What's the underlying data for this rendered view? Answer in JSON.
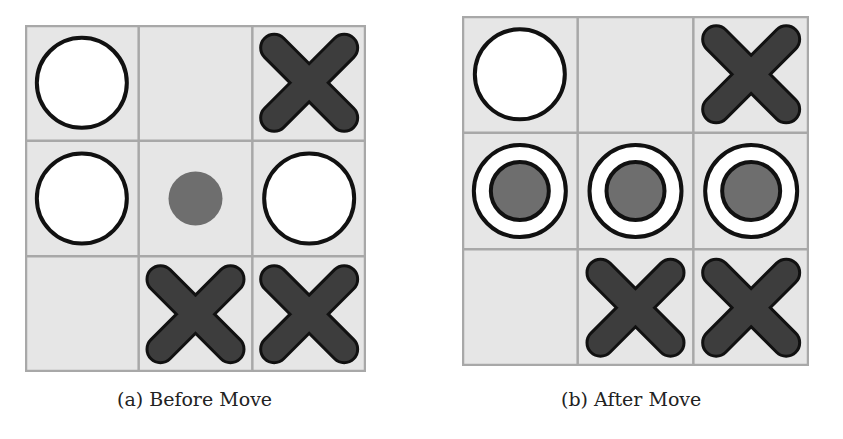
{
  "figure": {
    "panels": [
      {
        "id": "a",
        "caption": "(a) Before Move",
        "board": [
          [
            "O",
            "",
            "X"
          ],
          [
            "O",
            "dot",
            "O"
          ],
          [
            "",
            "X",
            "X"
          ]
        ]
      },
      {
        "id": "b",
        "caption": "(b) After Move",
        "board": [
          [
            "O",
            "",
            "X"
          ],
          [
            "O-win",
            "O-win",
            "O-win"
          ],
          [
            "",
            "X",
            "X"
          ]
        ]
      }
    ],
    "legend": {
      "O": "white circle (player O)",
      "X": "dark cross (player X)",
      "dot": "gray dot (proposed move)",
      "O-win": "O with gray center (winning row highlight)"
    },
    "colors": {
      "cell_bg": "#e6e6e6",
      "grid_line": "#a8a8a8",
      "outline": "#111111",
      "o_fill": "#ffffff",
      "x_fill": "#3d3d3d",
      "dot_fill": "#6e6e6e"
    }
  }
}
